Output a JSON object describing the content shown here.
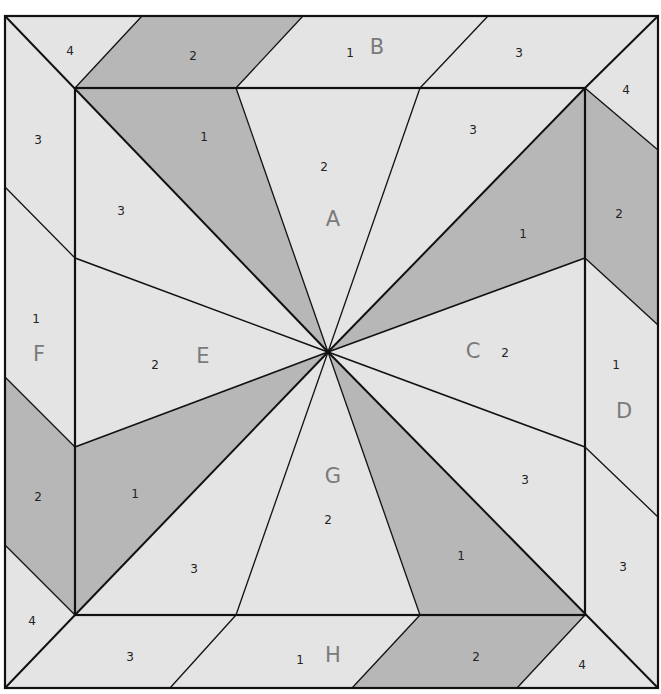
{
  "diagram": {
    "colors": {
      "light": "#e4e4e4",
      "dark": "#b7b7b7",
      "line": "#111111",
      "label": "#7a7a7a"
    },
    "sections": [
      {
        "id": "A",
        "label": "A",
        "pieces": [
          "1",
          "2",
          "3"
        ]
      },
      {
        "id": "B",
        "label": "B",
        "pieces": [
          "1",
          "2",
          "3",
          "4"
        ]
      },
      {
        "id": "C",
        "label": "C",
        "pieces": [
          "1",
          "2",
          "3"
        ]
      },
      {
        "id": "D",
        "label": "D",
        "pieces": [
          "1",
          "2",
          "3",
          "4"
        ]
      },
      {
        "id": "E",
        "label": "E",
        "pieces": [
          "1",
          "2",
          "3"
        ]
      },
      {
        "id": "F",
        "label": "F",
        "pieces": [
          "1",
          "2",
          "3",
          "4"
        ]
      },
      {
        "id": "G",
        "label": "G",
        "pieces": [
          "1",
          "2",
          "3"
        ]
      },
      {
        "id": "H",
        "label": "H",
        "pieces": [
          "1",
          "2",
          "3",
          "4"
        ]
      }
    ],
    "labels": {
      "A": "A",
      "B": "B",
      "C": "C",
      "D": "D",
      "E": "E",
      "F": "F",
      "G": "G",
      "H": "H",
      "A1": "1",
      "A2": "2",
      "A3": "3",
      "B1": "1",
      "B2": "2",
      "B3": "3",
      "B4": "4",
      "C1": "1",
      "C2": "2",
      "C3": "3",
      "D1": "1",
      "D2": "2",
      "D3": "3",
      "D4": "4",
      "E1": "1",
      "E2": "2",
      "E3": "3",
      "F1": "1",
      "F2": "2",
      "F3": "3",
      "F4": "4",
      "G1": "1",
      "G2": "2",
      "G3": "3",
      "H1": "1",
      "H2": "2",
      "H3": "3",
      "H4": "4"
    }
  }
}
